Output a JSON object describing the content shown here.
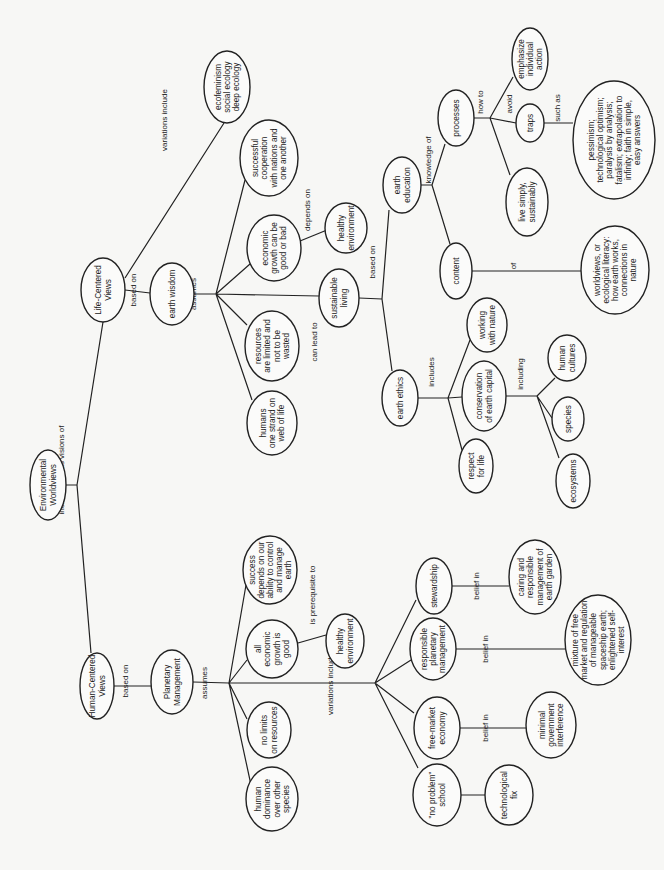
{
  "orientation": "rotated -90deg (reads bottom-to-top)",
  "nodes": [
    {
      "id": "root",
      "lines": [
        "Environmental",
        "Worldviews"
      ],
      "cx": 48,
      "cy": 485,
      "rx": 18,
      "ry": 35
    },
    {
      "id": "human",
      "lines": [
        "Human-Centered",
        "Views"
      ],
      "cx": 97,
      "cy": 686,
      "rx": 17,
      "ry": 33
    },
    {
      "id": "pm",
      "lines": [
        "Planetary",
        "Management"
      ],
      "cx": 172,
      "cy": 682,
      "rx": 21,
      "ry": 32
    },
    {
      "id": "hdom",
      "lines": [
        "human",
        "dominance",
        "over other",
        "species"
      ],
      "cx": 272,
      "cy": 799,
      "rx": 26,
      "ry": 32
    },
    {
      "id": "nolim",
      "lines": [
        "no limits",
        "on resources"
      ],
      "cx": 269,
      "cy": 730,
      "rx": 22,
      "ry": 28
    },
    {
      "id": "allgrowth",
      "lines": [
        "all",
        "economic",
        "growth is",
        "good"
      ],
      "cx": 272,
      "cy": 649,
      "rx": 26,
      "ry": 29
    },
    {
      "id": "success",
      "lines": [
        "success",
        "depends on our",
        "ability to control",
        "and manage",
        "earth"
      ],
      "cx": 270,
      "cy": 570,
      "rx": 27,
      "ry": 34
    },
    {
      "id": "hlth1",
      "lines": [
        "healthy",
        "environment"
      ],
      "cx": 345,
      "cy": 641,
      "rx": 19,
      "ry": 27
    },
    {
      "id": "noprob",
      "lines": [
        "\"no problem\"",
        "school"
      ],
      "cx": 437,
      "cy": 795,
      "rx": 24,
      "ry": 31
    },
    {
      "id": "freemkt",
      "lines": [
        "free-market",
        "economy"
      ],
      "cx": 437,
      "cy": 728,
      "rx": 23,
      "ry": 31
    },
    {
      "id": "rpm",
      "lines": [
        "responsible",
        "planetary",
        "management"
      ],
      "cx": 433,
      "cy": 649,
      "rx": 23,
      "ry": 31
    },
    {
      "id": "steward",
      "lines": [
        "stewardship"
      ],
      "cx": 434,
      "cy": 586,
      "rx": 18,
      "ry": 28
    },
    {
      "id": "techfix",
      "lines": [
        "technological",
        "fix"
      ],
      "cx": 509,
      "cy": 795,
      "rx": 24,
      "ry": 30
    },
    {
      "id": "mingov",
      "lines": [
        "minimal",
        "government",
        "interference"
      ],
      "cx": 551,
      "cy": 725,
      "rx": 25,
      "ry": 33
    },
    {
      "id": "caring",
      "lines": [
        "caring and",
        "responsible",
        "management of",
        "earth garden"
      ],
      "cx": 535,
      "cy": 577,
      "rx": 26,
      "ry": 37
    },
    {
      "id": "mixture",
      "lines": [
        "mixture of free",
        "market and regulation",
        "of manageable",
        "spaceship earth;",
        "enlightened self-",
        "interest"
      ],
      "cx": 598,
      "cy": 640,
      "rx": 33,
      "ry": 45
    },
    {
      "id": "life",
      "lines": [
        "Life-Centered",
        "Views"
      ],
      "cx": 103,
      "cy": 290,
      "rx": 22,
      "ry": 32
    },
    {
      "id": "wisdom",
      "lines": [
        "earth wisdom"
      ],
      "cx": 172,
      "cy": 294,
      "rx": 22,
      "ry": 31
    },
    {
      "id": "ecofem",
      "lines": [
        "ecofeminism",
        "social ecology",
        "deep ecology"
      ],
      "cx": 227,
      "cy": 87,
      "rx": 23,
      "ry": 36
    },
    {
      "id": "humstrand",
      "lines": [
        "humans",
        "one strand on",
        "web of life"
      ],
      "cx": 272,
      "cy": 423,
      "rx": 25,
      "ry": 32
    },
    {
      "id": "reslim",
      "lines": [
        "resources",
        "are limited and",
        "not to be",
        "wasted"
      ],
      "cx": 272,
      "cy": 346,
      "rx": 27,
      "ry": 35
    },
    {
      "id": "econgood",
      "lines": [
        "economic",
        "growth can be",
        "good or bad"
      ],
      "cx": 274,
      "cy": 248,
      "rx": 27,
      "ry": 33
    },
    {
      "id": "coop",
      "lines": [
        "successful",
        "cooperation",
        "with nations and",
        "one another"
      ],
      "cx": 269,
      "cy": 158,
      "rx": 29,
      "ry": 38
    },
    {
      "id": "hlth2",
      "lines": [
        "healthy",
        "environment"
      ],
      "cx": 346,
      "cy": 228,
      "rx": 21,
      "ry": 25
    },
    {
      "id": "sustliv",
      "lines": [
        "sustainable",
        "living"
      ],
      "cx": 339,
      "cy": 298,
      "rx": 20,
      "ry": 29
    },
    {
      "id": "ethics",
      "lines": [
        "earth ethics"
      ],
      "cx": 400,
      "cy": 398,
      "rx": 18,
      "ry": 28
    },
    {
      "id": "edu",
      "lines": [
        "earth",
        "education"
      ],
      "cx": 402,
      "cy": 185,
      "rx": 19,
      "ry": 28
    },
    {
      "id": "respect",
      "lines": [
        "respect",
        "for life"
      ],
      "cx": 476,
      "cy": 466,
      "rx": 17,
      "ry": 27
    },
    {
      "id": "conserv",
      "lines": [
        "conservation",
        "of earth capital"
      ],
      "cx": 484,
      "cy": 396,
      "rx": 22,
      "ry": 35
    },
    {
      "id": "working",
      "lines": [
        "working",
        "with nature"
      ],
      "cx": 487,
      "cy": 325,
      "rx": 20,
      "ry": 27
    },
    {
      "id": "ecosys",
      "lines": [
        "ecosystems"
      ],
      "cx": 573,
      "cy": 481,
      "rx": 17,
      "ry": 27
    },
    {
      "id": "species",
      "lines": [
        "species"
      ],
      "cx": 568,
      "cy": 419,
      "rx": 16,
      "ry": 22
    },
    {
      "id": "humcult",
      "lines": [
        "human",
        "cultures"
      ],
      "cx": 567,
      "cy": 358,
      "rx": 19,
      "ry": 23
    },
    {
      "id": "processes",
      "lines": [
        "processes"
      ],
      "cx": 456,
      "cy": 118,
      "rx": 18,
      "ry": 28
    },
    {
      "id": "content",
      "lines": [
        "content"
      ],
      "cx": 456,
      "cy": 271,
      "rx": 16,
      "ry": 28
    },
    {
      "id": "livesimp",
      "lines": [
        "live simply,",
        "sustainably"
      ],
      "cx": 527,
      "cy": 202,
      "rx": 21,
      "ry": 34
    },
    {
      "id": "traps",
      "lines": [
        "traps"
      ],
      "cx": 530,
      "cy": 123,
      "rx": 14,
      "ry": 19
    },
    {
      "id": "emph",
      "lines": [
        "emphasize",
        "individual",
        "action"
      ],
      "cx": 530,
      "cy": 59,
      "rx": 18,
      "ry": 31
    },
    {
      "id": "pessim",
      "lines": [
        "pessimism;",
        "technological optimism;",
        "paralysis by analysis;",
        "fatalism; extrapolation to",
        "infinity; faith in simple,",
        "easy answers"
      ],
      "cx": 614,
      "cy": 140,
      "rx": 41,
      "ry": 59
    },
    {
      "id": "worldv",
      "lines": [
        "worldviews, or",
        "ecological literacy:",
        "how earth works,",
        "connections in",
        "nature"
      ],
      "cx": 615,
      "cy": 270,
      "rx": 34,
      "ry": 44
    }
  ],
  "edges": [
    {
      "path": "M66,485 L77,485 M77,485 L91,653 M77,485 L103,322"
    },
    {
      "path": "M114,686 L151,686"
    },
    {
      "path": "M193,682 L229,683 M229,683 L251,785 M229,683 L247,719 M229,683 L247,660 M229,683 L246,585 M229,683 L375,683"
    },
    {
      "path": "M298,643 L326,635"
    },
    {
      "path": "M375,683 L418,768 M375,683 L414,713 M375,683 L411,660 M375,683 L416,600"
    },
    {
      "path": "M461,795 L485,795 M460,728 L526,728 M456,649 L565,649 M452,586 L509,586"
    },
    {
      "path": "M125,278 L224,123 M125,290 L150,293 M194,294 L216,294"
    },
    {
      "path": "M216,294 L252,400 M216,294 L247,325 M216,294 L250,264 M216,294 L245,180 M216,294 L319,296"
    },
    {
      "path": "M300,241 L327,230"
    },
    {
      "path": "M359,298 L382,299 M382,299 L392,371 M382,299 L389,210"
    },
    {
      "path": "M418,398 L448,398 M448,398 L462,450 M448,398 L462,397 M448,398 L470,340"
    },
    {
      "path": "M506,396 L537,396 M537,396 L559,458 M537,396 L552,418 M537,396 L555,378"
    },
    {
      "path": "M421,185 L432,185 M432,185 L445,144 M432,185 L450,244"
    },
    {
      "path": "M474,118 L490,118 M490,118 L516,123 M490,118 L513,77 M490,118 L510,175 M544,123 L573,123"
    },
    {
      "path": "M472,271 L581,271"
    }
  ],
  "edge_labels": [
    {
      "text": "include various visions of",
      "x": 64,
      "y": 470
    },
    {
      "text": "based on",
      "x": 128,
      "y": 681
    },
    {
      "text": "assumes",
      "x": 207,
      "y": 683
    },
    {
      "text": "is prerequisite to",
      "x": 315,
      "y": 595
    },
    {
      "text": "variations include",
      "x": 333,
      "y": 684
    },
    {
      "text": "belief in",
      "x": 456,
      "y": 795
    },
    {
      "text": "belief in",
      "x": 488,
      "y": 728
    },
    {
      "text": "belief in",
      "x": 488,
      "y": 649
    },
    {
      "text": "belief in",
      "x": 479,
      "y": 586
    },
    {
      "text": "based on",
      "x": 136,
      "y": 290
    },
    {
      "text": "assumes",
      "x": 196,
      "y": 294
    },
    {
      "text": "variations include",
      "x": 167,
      "y": 120
    },
    {
      "text": "depends on",
      "x": 310,
      "y": 210
    },
    {
      "text": "can lead to",
      "x": 317,
      "y": 342
    },
    {
      "text": "based on",
      "x": 375,
      "y": 262
    },
    {
      "text": "includes",
      "x": 434,
      "y": 372
    },
    {
      "text": "including",
      "x": 523,
      "y": 374
    },
    {
      "text": "knowledge of",
      "x": 431,
      "y": 160
    },
    {
      "text": "how to",
      "x": 483,
      "y": 102
    },
    {
      "text": "avoid",
      "x": 512,
      "y": 104
    },
    {
      "text": "such as",
      "x": 560,
      "y": 108
    },
    {
      "text": "of",
      "x": 516,
      "y": 266
    }
  ]
}
